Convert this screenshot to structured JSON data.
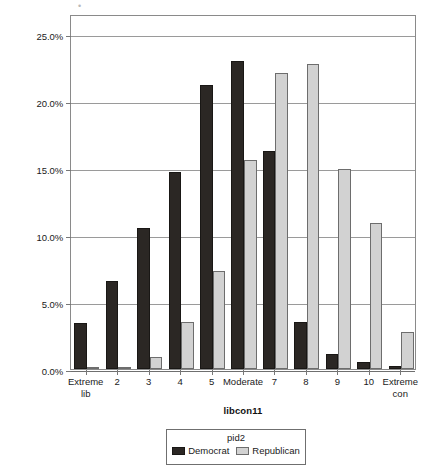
{
  "chart_data": {
    "type": "bar",
    "title": "",
    "xlabel": "libcon11",
    "ylabel": "Percent",
    "grid": true,
    "legend_position": "bottom",
    "legend_title": "pid2",
    "ylim": [
      0,
      26.5
    ],
    "yticks": [
      0,
      5,
      10,
      15,
      20,
      25
    ],
    "ytick_labels": [
      "0.0%",
      "5.0%",
      "10.0%",
      "15.0%",
      "20.0%",
      "25.0%"
    ],
    "categories": [
      "Extreme\nlib",
      "2",
      "3",
      "4",
      "5",
      "Moderate",
      "7",
      "8",
      "9",
      "10",
      "Extreme\ncon"
    ],
    "series": [
      {
        "name": "Democrat",
        "color": "#2b2724",
        "values": [
          3.4,
          6.6,
          10.5,
          14.7,
          21.2,
          23.0,
          16.3,
          3.5,
          1.1,
          0.5,
          0.2
        ]
      },
      {
        "name": "Republican",
        "color": "#d2d2d2",
        "values": [
          0.1,
          0.1,
          0.9,
          3.5,
          7.3,
          15.6,
          22.1,
          22.8,
          14.9,
          10.9,
          2.8
        ]
      }
    ]
  },
  "legend": {
    "title": "pid2",
    "items": [
      {
        "label": "Democrat",
        "swatch": "dark-swatch"
      },
      {
        "label": "Republican",
        "swatch": "light-swatch"
      }
    ]
  },
  "axes": {
    "y_title": "Percent",
    "x_title": "libcon11"
  },
  "artifact": {
    "mark": "•"
  }
}
